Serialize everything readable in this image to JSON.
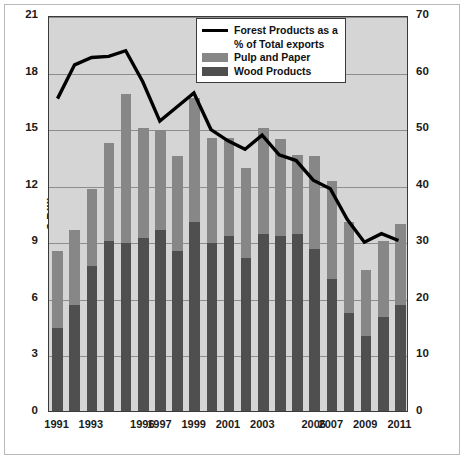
{
  "chart_data": {
    "type": "bar",
    "title": "",
    "xlabel": "",
    "ylabel": "$ Billions",
    "y2label": "% Share",
    "ylim": [
      0,
      21
    ],
    "y2lim": [
      0,
      70
    ],
    "yticks": [
      0,
      3,
      6,
      9,
      12,
      15,
      18,
      21
    ],
    "y2ticks": [
      0,
      10,
      20,
      30,
      40,
      50,
      60,
      70
    ],
    "grid": true,
    "stacked": true,
    "legend_position": "top-right",
    "categories": [
      1991,
      1992,
      1993,
      1994,
      1995,
      1996,
      1997,
      1998,
      1999,
      2000,
      2001,
      2002,
      2003,
      2004,
      2005,
      2006,
      2007,
      2008,
      2009,
      2010,
      2011
    ],
    "xtick_labels": [
      "1991",
      "",
      "1993",
      "",
      "",
      "1996",
      "1997",
      "",
      "1999",
      "",
      "2001",
      "",
      "2003",
      "",
      "",
      "2006",
      "2007",
      "",
      "2009",
      "",
      "2011"
    ],
    "series": [
      {
        "name": "Wood Products",
        "type": "bar",
        "axis": "left",
        "color": "#4f4f4f",
        "values": [
          4.4,
          5.6,
          7.7,
          9.0,
          8.9,
          9.2,
          9.6,
          8.5,
          10.0,
          8.9,
          9.3,
          8.1,
          9.4,
          9.3,
          9.4,
          8.6,
          7.0,
          5.2,
          4.0,
          5.0,
          5.6
        ]
      },
      {
        "name": "Pulp and Paper",
        "type": "bar",
        "axis": "left",
        "color": "#878787",
        "values": [
          4.1,
          4.0,
          4.1,
          5.2,
          7.9,
          5.8,
          5.3,
          5.0,
          6.6,
          5.6,
          5.2,
          4.8,
          5.6,
          5.1,
          4.2,
          4.9,
          5.2,
          4.8,
          3.5,
          4.0,
          4.3
        ]
      },
      {
        "name": "Total (stack top, $B)",
        "type": "bar-total",
        "axis": "left",
        "values": [
          8.5,
          9.6,
          11.8,
          14.2,
          16.8,
          15.0,
          14.9,
          13.5,
          16.6,
          14.5,
          14.5,
          12.9,
          15.0,
          14.4,
          13.6,
          13.5,
          12.2,
          10.0,
          7.5,
          9.0,
          9.9
        ]
      },
      {
        "name": "Forest Products as a % of Total exports",
        "type": "line",
        "axis": "right",
        "color": "#000000",
        "values": [
          55.5,
          61.5,
          62.8,
          63.0,
          64.0,
          58.5,
          51.5,
          54.0,
          56.5,
          50.0,
          48.0,
          46.5,
          49.0,
          45.5,
          44.5,
          41.0,
          39.5,
          34.0,
          30.0,
          31.5,
          30.3
        ]
      }
    ]
  },
  "axes": {
    "left_title": "$ Billions",
    "right_title": "% Share",
    "left_ticks": [
      "21",
      "18",
      "15",
      "12",
      "9",
      "6",
      "3",
      "0"
    ],
    "right_ticks": [
      "70",
      "60",
      "50",
      "40",
      "30",
      "20",
      "10",
      "0"
    ]
  },
  "legend": {
    "items": [
      {
        "label_line1": "Forest Products as a",
        "label_line2": "% of Total exports",
        "swatch": "line-swatch"
      },
      {
        "label_line1": "Pulp and Paper",
        "swatch": "pulp-swatch"
      },
      {
        "label_line1": "Wood Products",
        "swatch": "wood-swatch"
      }
    ]
  }
}
